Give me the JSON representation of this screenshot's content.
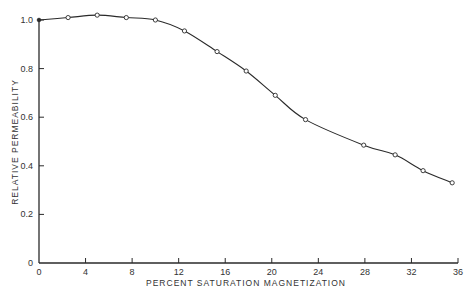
{
  "chart_data": {
    "type": "line",
    "title": "",
    "xlabel": "PERCENT SATURATION MAGNETIZATION",
    "ylabel": "RELATIVE PERMEABILITY",
    "xlim": [
      0,
      36
    ],
    "ylim": [
      0,
      1.0
    ],
    "x_ticks": [
      0,
      4,
      8,
      12,
      16,
      20,
      24,
      28,
      32,
      36
    ],
    "x_tick_labels": [
      "0",
      "4",
      "8",
      "12",
      "16",
      "20",
      "24",
      "28",
      "32",
      "36"
    ],
    "y_ticks": [
      0,
      0.2,
      0.4,
      0.6,
      0.8,
      1.0
    ],
    "y_tick_labels": [
      "0",
      "0.2",
      "0.4",
      "0.6",
      "0.8",
      "1.0"
    ],
    "grid": false,
    "legend": null,
    "marker": "open-circle",
    "series": [
      {
        "name": "Relative permeability",
        "x": [
          0,
          2.5,
          5.0,
          7.5,
          10.0,
          12.5,
          15.3,
          17.8,
          20.3,
          22.9,
          27.9,
          30.6,
          33.0,
          35.5
        ],
        "y": [
          1.0,
          1.01,
          1.02,
          1.01,
          1.0,
          0.955,
          0.87,
          0.79,
          0.69,
          0.59,
          0.485,
          0.445,
          0.38,
          0.33
        ]
      }
    ]
  },
  "colors": {
    "line": "#2a2a2a",
    "axis": "#2a2a2a",
    "background": "#ffffff"
  }
}
